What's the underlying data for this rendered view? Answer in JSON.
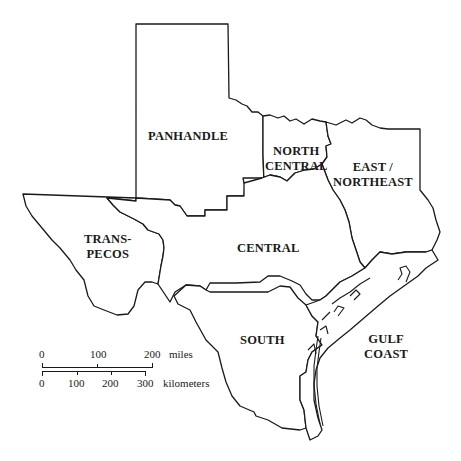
{
  "map": {
    "title": "Texas regions",
    "regions": [
      {
        "id": "panhandle",
        "label_lines": [
          "PANHANDLE"
        ]
      },
      {
        "id": "north-central",
        "label_lines": [
          "NORTH",
          "CENTRAL"
        ]
      },
      {
        "id": "east-northeast",
        "label_lines": [
          "EAST /",
          "NORTHEAST"
        ]
      },
      {
        "id": "trans-pecos",
        "label_lines": [
          "TRANS-",
          "PECOS"
        ]
      },
      {
        "id": "central",
        "label_lines": [
          "CENTRAL"
        ]
      },
      {
        "id": "south",
        "label_lines": [
          "SOUTH"
        ]
      },
      {
        "id": "gulf-coast",
        "label_lines": [
          "GULF",
          "COAST"
        ]
      }
    ]
  },
  "scale_bar": {
    "miles": {
      "ticks": [
        "0",
        "100",
        "200"
      ],
      "unit": "miles"
    },
    "kilometers": {
      "ticks": [
        "0",
        "100",
        "200",
        "300"
      ],
      "unit": "kilometers"
    }
  }
}
